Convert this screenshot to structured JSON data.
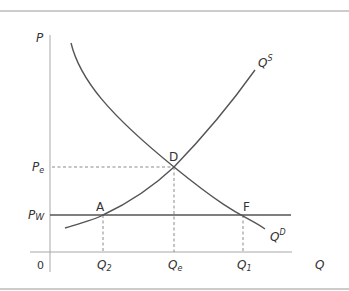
{
  "diagram": {
    "type": "supply-demand-world-price",
    "colors": {
      "curve": "#555555",
      "axis": "#9a9a9a",
      "dashed": "#8a8a8a",
      "rule": "#999999",
      "text": "#333333"
    },
    "axes": {
      "y_label": "P",
      "x_label": "Q",
      "origin_label": "0"
    },
    "price_labels": {
      "pe_main": "P",
      "pe_sub": "e",
      "pw_main": "P",
      "pw_sub": "W"
    },
    "quantity_labels": {
      "q2_main": "Q",
      "q2_sub": "2",
      "qe_main": "Q",
      "qe_sub": "e",
      "q1_main": "Q",
      "q1_sub": "1"
    },
    "curves": {
      "supply_main": "Q",
      "supply_sup": "S",
      "demand_main": "Q",
      "demand_sup": "D"
    },
    "points": {
      "equilibrium": "D",
      "domestic_supply_at_world_price": "A",
      "domestic_demand_at_world_price": "F"
    }
  }
}
